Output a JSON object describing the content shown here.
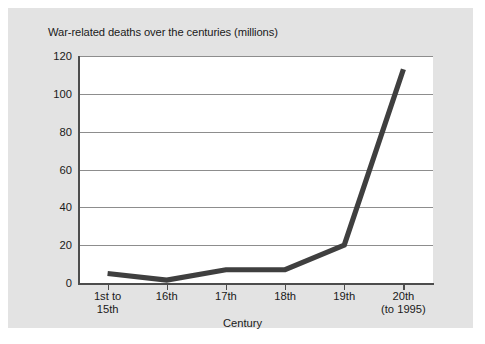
{
  "figure": {
    "title": "War-related deaths over the centuries (millions)",
    "background_color": "#e3e3e3",
    "plot_background_color": "#ffffff",
    "line_color": "#3f3f3f",
    "grid_color": "#8d8d8d",
    "axis_color": "#4d4d4d"
  },
  "chart_data": {
    "type": "line",
    "title": "War-related deaths over the centuries (millions)",
    "xlabel": "Century",
    "ylabel": "",
    "categories": [
      "1st to\n15th",
      "16th",
      "17th",
      "18th",
      "19th",
      "20th\n(to 1995)"
    ],
    "category_labels_line1": [
      "1st to",
      "16th",
      "17th",
      "18th",
      "19th",
      "20th"
    ],
    "category_labels_line2": [
      "15th",
      "",
      "",
      "",
      "",
      "(to 1995)"
    ],
    "values": [
      5,
      1.5,
      7,
      7,
      20,
      113
    ],
    "ylim": [
      0,
      120
    ],
    "yticks": [
      0,
      20,
      40,
      60,
      80,
      100,
      120
    ],
    "ytick_labels": [
      "0",
      "20",
      "40",
      "60",
      "80",
      "100",
      "120"
    ],
    "grid": "horizontal",
    "legend": "none",
    "units": "millions"
  }
}
